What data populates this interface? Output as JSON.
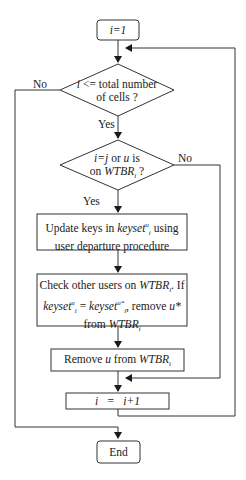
{
  "flowchart": {
    "start": "i=1",
    "decision1": {
      "line1_var": "i",
      "line1_rest": " <= total number",
      "line2": "of cells ?"
    },
    "decision2": {
      "l1a": "i=j",
      "l1b": " or ",
      "l1c": "u",
      "l1d": " is",
      "l2a": "on ",
      "l2b": "WTBR",
      "l2sub": "i",
      "l2c": " ?"
    },
    "update": {
      "l1a": "Update keys in ",
      "l1b": "keyset",
      "l1sup": "u",
      "l1sub": "i",
      "l1c": " using",
      "l2": "user departure procedure"
    },
    "check": {
      "l1a": "Check other users on ",
      "l1b": "WTBR",
      "l1sub": "i",
      "l1c": ". If",
      "l2a": "keyset",
      "l2sup": "u",
      "l2sub": "i",
      "l2b": " = ",
      "l2c": "keyset",
      "l2sup2": "u*",
      "l2sub2": "i",
      "l2d": ", remove ",
      "l2e": "u*",
      "l3a": "from ",
      "l3b": "WTBR",
      "l3sub": "i"
    },
    "remove": {
      "a": "Remove ",
      "b": "u",
      "c": " from ",
      "d": "WTBR",
      "sub": "i"
    },
    "increment": "i   =   i+1",
    "end": "End",
    "labels": {
      "yes1": "Yes",
      "no1": "No",
      "yes2": "Yes",
      "no2": "No"
    }
  }
}
